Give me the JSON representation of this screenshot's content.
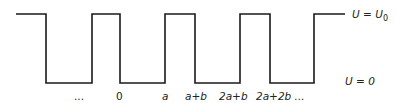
{
  "diagram": {
    "levels": {
      "high": {
        "label": "U = U",
        "subscript": "0",
        "y": 14
      },
      "low": {
        "label": "U = 0",
        "y": 83
      }
    },
    "waveform_points": "16,14 46,14 46,83 92,83 92,14 120,14 120,83 165,83 165,14 195,14 195,83 240,83 240,14 270,14 270,83 314,83 314,14 345,14",
    "x_labels": [
      {
        "text": "...",
        "x": 74
      },
      {
        "text": "0",
        "x": 120
      },
      {
        "text": "a",
        "x": 165
      },
      {
        "text": "a+b",
        "x": 195
      },
      {
        "text": "2a+b",
        "x": 240
      },
      {
        "text": "2a+2b ...",
        "x": 270
      }
    ],
    "colors": {
      "line": "#1a1a1a",
      "text": "#222222",
      "background": "#ffffff"
    }
  }
}
